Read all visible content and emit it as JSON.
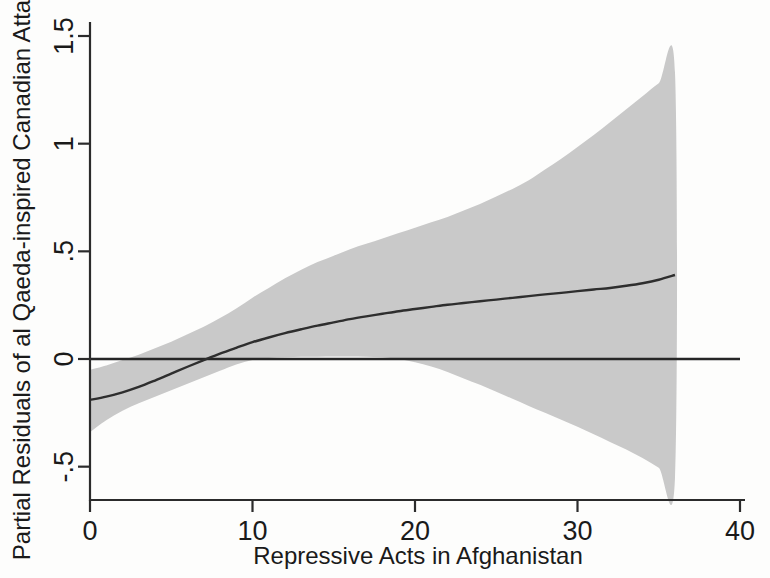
{
  "chart_data": {
    "type": "line",
    "title": "",
    "subtitle": "",
    "xlabel": "Repressive Acts in Afghanistan",
    "ylabel": "Partial Residuals of al Qaeda-inspired Canadian Attacks",
    "xlim": [
      0,
      40
    ],
    "ylim": [
      -0.72,
      1.56
    ],
    "xticks": [
      0,
      10,
      20,
      30,
      40
    ],
    "xticklabels": [
      "0",
      "10",
      "20",
      "30",
      "40"
    ],
    "yticks": [
      -0.5,
      0,
      0.5,
      1,
      1.5
    ],
    "yticklabels": [
      "-.5",
      "0",
      ".5",
      "1",
      "1.5"
    ],
    "grid": false,
    "legend": null,
    "legend_position": "none",
    "colors": {
      "fit_line": "#2e2e2e",
      "confidence_band": "#c9c9c9",
      "zero_reference_line": "#262626",
      "axis": "#2b2b2b",
      "background": "#fdfdfc"
    },
    "annotations": [
      {
        "name": "zero-reference-line",
        "type": "horizontal-line",
        "y": 0,
        "x_start": 0,
        "x_end": 40
      }
    ],
    "series": [
      {
        "name": "Partial residual fit (LOESS / smoothed partial effect)",
        "type": "line",
        "x": [
          0,
          1,
          2,
          3,
          4,
          5,
          6,
          7,
          8,
          9,
          10,
          11,
          12,
          13,
          14,
          15,
          16,
          17,
          18,
          19,
          20,
          21,
          22,
          23,
          24,
          25,
          26,
          27,
          28,
          29,
          30,
          31,
          32,
          33,
          34,
          35,
          36
        ],
        "values": [
          -0.19,
          -0.175,
          -0.155,
          -0.13,
          -0.1,
          -0.068,
          -0.036,
          -0.005,
          0.025,
          0.052,
          0.078,
          0.1,
          0.12,
          0.138,
          0.155,
          0.17,
          0.185,
          0.198,
          0.21,
          0.222,
          0.232,
          0.242,
          0.252,
          0.26,
          0.268,
          0.276,
          0.284,
          0.292,
          0.3,
          0.307,
          0.315,
          0.323,
          0.33,
          0.34,
          0.352,
          0.368,
          0.39
        ]
      },
      {
        "name": "95% confidence interval — upper bound",
        "type": "band-upper",
        "x": [
          0,
          1,
          2,
          3,
          4,
          5,
          6,
          7,
          8,
          9,
          10,
          11,
          12,
          13,
          14,
          15,
          16,
          17,
          18,
          19,
          20,
          21,
          22,
          23,
          24,
          25,
          26,
          27,
          28,
          29,
          30,
          31,
          32,
          33,
          34,
          35,
          36
        ],
        "values": [
          -0.05,
          -0.03,
          -0.005,
          0.02,
          0.05,
          0.08,
          0.115,
          0.15,
          0.19,
          0.235,
          0.285,
          0.33,
          0.375,
          0.415,
          0.45,
          0.48,
          0.51,
          0.535,
          0.56,
          0.585,
          0.61,
          0.635,
          0.66,
          0.69,
          0.72,
          0.755,
          0.79,
          0.83,
          0.88,
          0.93,
          0.985,
          1.04,
          1.1,
          1.16,
          1.22,
          1.28,
          1.33
        ]
      },
      {
        "name": "95% confidence interval — lower bound",
        "type": "band-lower",
        "x": [
          0,
          1,
          2,
          3,
          4,
          5,
          6,
          7,
          8,
          9,
          10,
          11,
          12,
          13,
          14,
          15,
          16,
          17,
          18,
          19,
          20,
          21,
          22,
          23,
          24,
          25,
          26,
          27,
          28,
          29,
          30,
          31,
          32,
          33,
          34,
          35,
          36
        ],
        "values": [
          -0.34,
          -0.285,
          -0.24,
          -0.205,
          -0.175,
          -0.145,
          -0.115,
          -0.085,
          -0.055,
          -0.025,
          -0.005,
          0.005,
          0.008,
          0.01,
          0.011,
          0.012,
          0.012,
          0.011,
          0.008,
          0.0,
          -0.015,
          -0.035,
          -0.06,
          -0.09,
          -0.12,
          -0.152,
          -0.185,
          -0.218,
          -0.25,
          -0.282,
          -0.315,
          -0.35,
          -0.385,
          -0.42,
          -0.46,
          -0.505,
          -0.55
        ]
      }
    ]
  }
}
